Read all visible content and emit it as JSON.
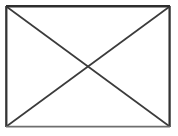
{
  "image": {
    "width": 178,
    "height": 136,
    "background_color": "#ffffff",
    "description": "broken-image-placeholder"
  },
  "placeholder": {
    "kind": "missing-image-placeholder",
    "label": "",
    "shape": "rectangle-with-crossed-diagonals",
    "frame": {
      "x": 6,
      "y": 6,
      "width": 164,
      "height": 121,
      "stroke_color": "#3a3a3a",
      "stroke_width": 2.2,
      "fill": "#ffffff"
    },
    "diagonals": {
      "stroke_color": "#3b3b3b",
      "stroke_width": 1.6,
      "lines": [
        {
          "name": "diagonal-top-left-to-bottom-right",
          "x1": 7,
          "y1": 7,
          "x2": 169,
          "y2": 126
        },
        {
          "name": "diagonal-bottom-left-to-top-right",
          "x1": 7,
          "y1": 126,
          "x2": 169,
          "y2": 7
        }
      ]
    },
    "edges": {
      "top_stroke_color": "#2e2e2e",
      "left_stroke_color": "#343434",
      "right_stroke_color": "#343434",
      "bottom_stroke_color": "#6e6e6e"
    }
  }
}
